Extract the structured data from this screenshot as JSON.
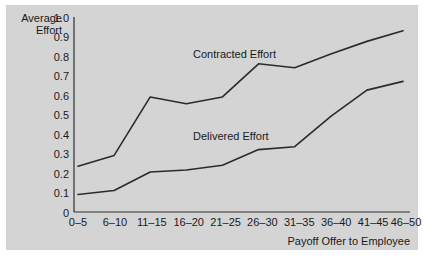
{
  "chart_data": {
    "type": "line",
    "title": "",
    "subtitle": "",
    "xlabel": "Payoff Offer to Employee",
    "ylabel": "Average Effort",
    "ylabel_line1": "Average",
    "ylabel_line2": "Effort",
    "categories": [
      "0–5",
      "6–10",
      "11–15",
      "16–20",
      "21–25",
      "26–30",
      "31–35",
      "36–40",
      "41–45",
      "46–50"
    ],
    "ylim": [
      0,
      1.0
    ],
    "ytick_labels": [
      "0",
      "0.1",
      "0.2",
      "0.3",
      "0.4",
      "0.5",
      "0.6",
      "0.7",
      "0.8",
      "0.9",
      "1.0"
    ],
    "ytick_values": [
      0,
      0.1,
      0.2,
      0.3,
      0.4,
      0.5,
      0.6,
      0.7,
      0.8,
      0.9,
      1.0
    ],
    "grid": false,
    "legend_position": "inline-annotations",
    "series": [
      {
        "name": "Contracted Effort",
        "values": [
          0.235,
          0.29,
          0.59,
          0.555,
          0.59,
          0.76,
          0.74,
          0.81,
          0.875,
          0.93
        ],
        "color": "#2b2b2b"
      },
      {
        "name": "Delivered Effort",
        "values": [
          0.09,
          0.11,
          0.205,
          0.215,
          0.24,
          0.32,
          0.335,
          0.49,
          0.625,
          0.67
        ],
        "color": "#2b2b2b"
      }
    ],
    "annotations": [
      {
        "text": "Contracted Effort",
        "series": "Contracted Effort"
      },
      {
        "text": "Delivered Effort",
        "series": "Delivered Effort"
      }
    ]
  },
  "colors": {
    "panel_background": "#d4d4d4",
    "page_background": "#ffffff",
    "line": "#2b2b2b",
    "axis": "#303030",
    "text": "#1a1a1a"
  }
}
